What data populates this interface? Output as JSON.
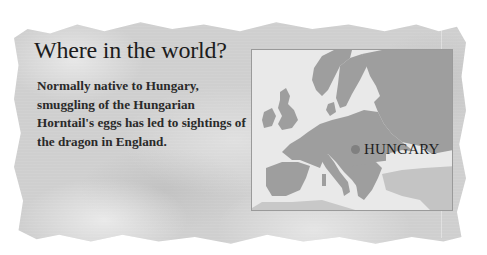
{
  "panel": {
    "title": "Where in the world?",
    "body": "Normally native to Hungary, smuggling of the Hungarian Horntail's eggs has led to sightings of the dragon in England."
  },
  "map": {
    "region": "Europe",
    "marker": {
      "label": "HUNGARY",
      "color": "#808080"
    },
    "colors": {
      "land": "#9e9e9e",
      "sea": "#e9e9e9",
      "paper": "#cfcfcf"
    }
  }
}
